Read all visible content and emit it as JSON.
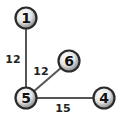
{
  "graph": {
    "nodes": [
      {
        "id": "1",
        "label": "1",
        "x": 26,
        "y": 18
      },
      {
        "id": "6",
        "label": "6",
        "x": 69,
        "y": 61
      },
      {
        "id": "5",
        "label": "5",
        "x": 26,
        "y": 98
      },
      {
        "id": "4",
        "label": "4",
        "x": 104,
        "y": 98
      }
    ],
    "edges": [
      {
        "from": "1",
        "to": "5",
        "weight": "12",
        "label_x": 13,
        "label_y": 63
      },
      {
        "from": "6",
        "to": "5",
        "weight": "12",
        "label_x": 41,
        "label_y": 74
      },
      {
        "from": "5",
        "to": "4",
        "weight": "15",
        "label_x": 63,
        "label_y": 111
      }
    ]
  }
}
